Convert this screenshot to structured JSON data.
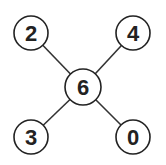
{
  "diagram": {
    "type": "star-graph",
    "nodes": [
      {
        "id": "center",
        "label": "6",
        "cx": 83,
        "cy": 87,
        "r": 18
      },
      {
        "id": "top-left",
        "label": "2",
        "cx": 31,
        "cy": 33,
        "r": 17
      },
      {
        "id": "top-right",
        "label": "4",
        "cx": 133,
        "cy": 33,
        "r": 17
      },
      {
        "id": "bottom-left",
        "label": "3",
        "cx": 31,
        "cy": 137,
        "r": 17
      },
      {
        "id": "bottom-right",
        "label": "0",
        "cx": 133,
        "cy": 137,
        "r": 17
      }
    ],
    "edges": [
      {
        "from": "center",
        "to": "top-left"
      },
      {
        "from": "center",
        "to": "top-right"
      },
      {
        "from": "center",
        "to": "bottom-left"
      },
      {
        "from": "center",
        "to": "bottom-right"
      }
    ],
    "colors": {
      "stroke": "#222222",
      "fill": "#ffffff",
      "text": "#222222"
    }
  }
}
